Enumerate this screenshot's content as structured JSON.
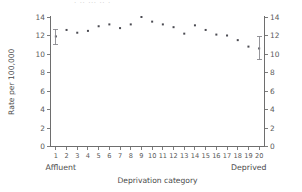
{
  "figure": {
    "top_cropped_artifact": "· ·· ··· ·· ·",
    "background_color": "#ffffff",
    "marker_color": "#4b4b52",
    "axis_color": "#6e6e6e",
    "errorbar_color": "#8b8b90"
  },
  "chart_data": {
    "type": "scatter",
    "title": "",
    "xlabel": "Deprivation category",
    "ylabel": "Rate per 100,000",
    "ylabel_right": "",
    "x": [
      1,
      2,
      3,
      4,
      5,
      6,
      7,
      8,
      9,
      10,
      11,
      12,
      13,
      14,
      15,
      16,
      17,
      18,
      19,
      20
    ],
    "categories": [
      "1",
      "2",
      "3",
      "4",
      "5",
      "6",
      "7",
      "8",
      "9",
      "10",
      "11",
      "12",
      "13",
      "14",
      "15",
      "16",
      "17",
      "18",
      "19",
      "20"
    ],
    "values": [
      11.9,
      12.6,
      12.3,
      12.5,
      13.0,
      13.2,
      12.8,
      13.2,
      14.0,
      13.5,
      13.2,
      12.9,
      12.2,
      13.1,
      12.6,
      12.1,
      12.0,
      11.5,
      10.8,
      10.6
    ],
    "error_bars": [
      {
        "x": 1,
        "value": 11.9,
        "low": 11.0,
        "high": 12.7
      },
      {
        "x": 20,
        "value": 10.6,
        "low": 9.4,
        "high": 11.9
      }
    ],
    "ylim": [
      0,
      14
    ],
    "yticks": [
      0,
      2,
      4,
      6,
      8,
      10,
      12,
      14
    ],
    "ytick_labels": [
      "0",
      "2",
      "4",
      "6",
      "8",
      "10",
      "12",
      "14"
    ],
    "yticks_right": [
      0,
      2,
      4,
      6,
      8,
      10,
      12,
      14
    ],
    "ytick_labels_right": [
      "0",
      "2",
      "4",
      "6",
      "8",
      "10",
      "12",
      "14"
    ],
    "xlim": [
      0.5,
      20.5
    ],
    "grid": false,
    "legend": false,
    "axis_end_labels": {
      "left": "Affluent",
      "right": "Deprived"
    }
  }
}
